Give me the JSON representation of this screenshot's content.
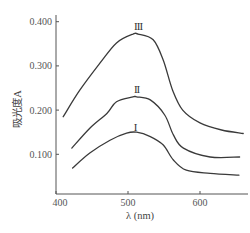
{
  "chart_data": {
    "type": "line",
    "title": "",
    "xlabel": "λ (nm)",
    "ylabel": "吸光度A",
    "xlim": [
      400,
      665
    ],
    "ylim": [
      0.01,
      0.415
    ],
    "grid": false,
    "legend": "none (series labelled inline above peaks)",
    "xticks": [
      400,
      500,
      600
    ],
    "xtick_labels": [
      "400",
      "500",
      "600"
    ],
    "yticks": [
      0.1,
      0.2,
      0.3,
      0.4
    ],
    "ytick_labels": [
      "0.100",
      "0.200",
      "0.300",
      "0.400"
    ],
    "series": [
      {
        "name": "III",
        "label_pos": [
          514,
          0.39
        ],
        "x": [
          410,
          433,
          461,
          484,
          507,
          514,
          535,
          549,
          562,
          576,
          600,
          630,
          660
        ],
        "y": [
          0.185,
          0.245,
          0.306,
          0.352,
          0.372,
          0.372,
          0.359,
          0.313,
          0.245,
          0.2,
          0.171,
          0.155,
          0.147
        ]
      },
      {
        "name": "II",
        "label_pos": [
          512,
          0.248
        ],
        "x": [
          422,
          447,
          471,
          484,
          507,
          512,
          531,
          551,
          563,
          577,
          614,
          655
        ],
        "y": [
          0.114,
          0.159,
          0.193,
          0.219,
          0.23,
          0.23,
          0.223,
          0.189,
          0.144,
          0.114,
          0.094,
          0.094
        ]
      },
      {
        "name": "I",
        "label_pos": [
          510,
          0.162
        ],
        "x": [
          423,
          447,
          475,
          498,
          512,
          531,
          549,
          563,
          581,
          614,
          654
        ],
        "y": [
          0.069,
          0.103,
          0.132,
          0.148,
          0.15,
          0.14,
          0.121,
          0.087,
          0.064,
          0.057,
          0.053
        ]
      }
    ]
  }
}
